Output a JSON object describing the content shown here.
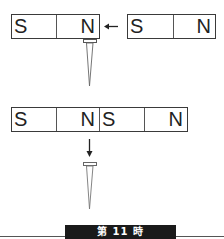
{
  "diagram": {
    "top_row": {
      "magnet_left": {
        "poles": [
          "S",
          "N"
        ]
      },
      "arrow": {
        "direction": "left",
        "icon": "arrow-left-icon"
      },
      "magnet_right": {
        "poles": [
          "S",
          "N"
        ]
      },
      "nail": {
        "state": "hanging from N pole",
        "icon": "nail-icon"
      }
    },
    "bottom_row": {
      "magnet_joined": {
        "poles": [
          "S",
          "N",
          "S",
          "N"
        ]
      },
      "arrow": {
        "direction": "down",
        "icon": "arrow-down-icon"
      },
      "nail": {
        "state": "fallen / released",
        "icon": "nail-icon"
      }
    }
  },
  "footer": {
    "label": "第 11 時"
  },
  "colors": {
    "line": "#3a3a3a",
    "footer_bg": "#1a1a1a",
    "footer_text": "#ffffff"
  }
}
